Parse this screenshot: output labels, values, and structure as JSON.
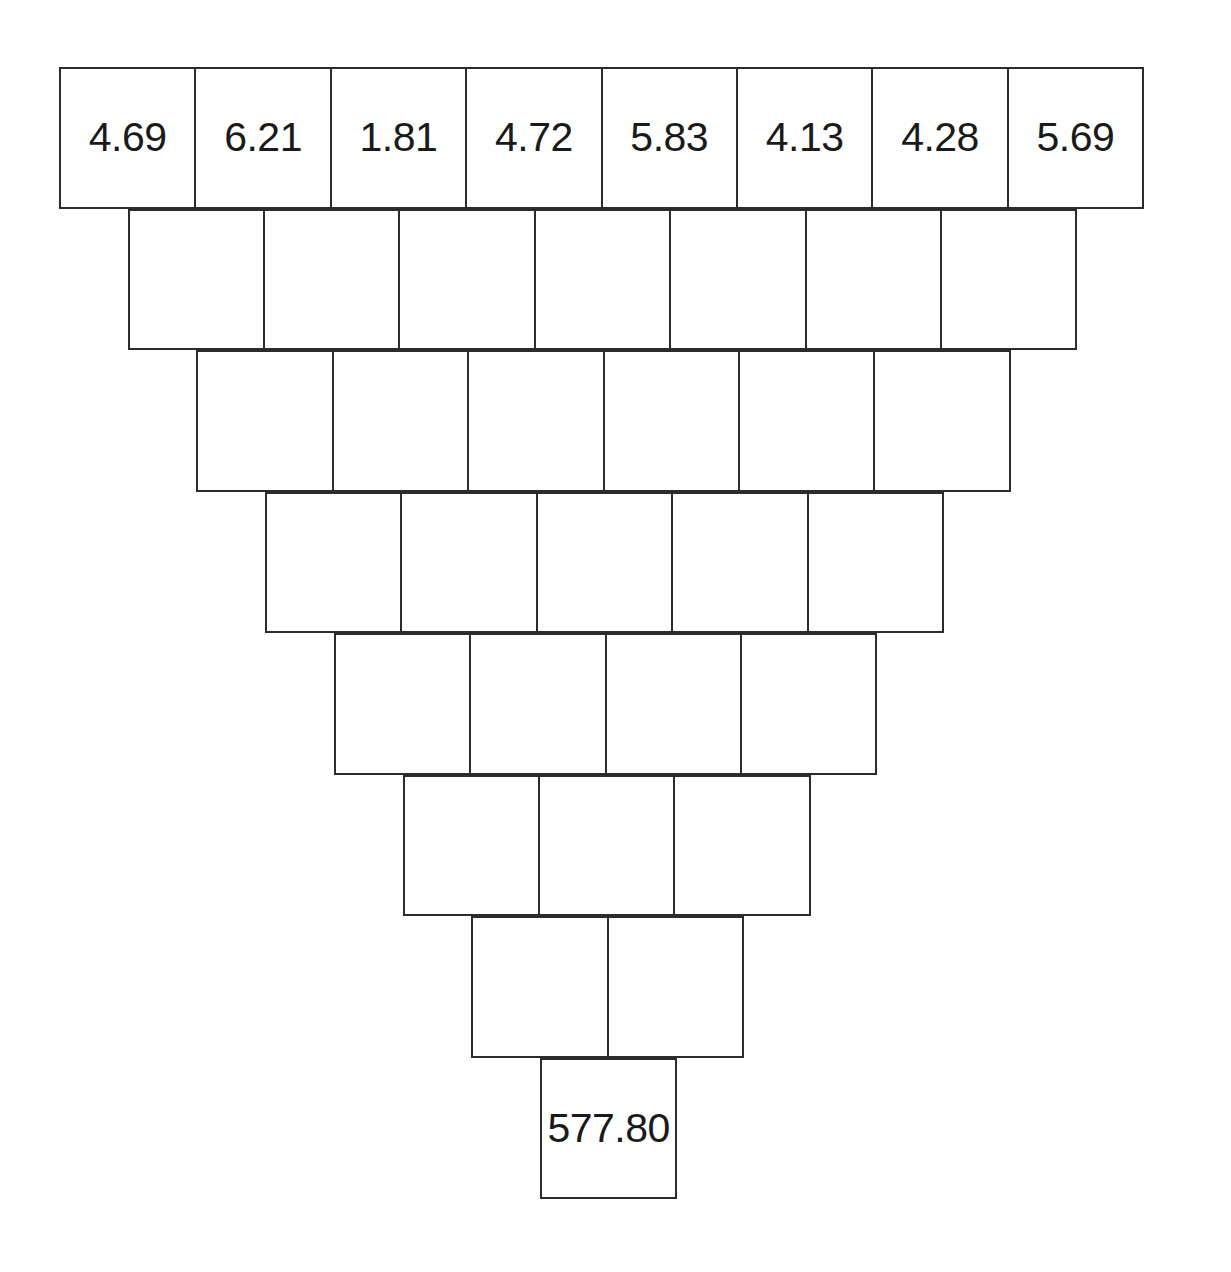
{
  "figure": {
    "name": "number-pyramid",
    "background_color": "#ffffff",
    "line_color": "#2b2b2b",
    "text_color": "#1a1a1a"
  },
  "layout": {
    "origin_x": 59,
    "origin_y": 67,
    "cell_width": 137.4,
    "cell_height": 141.5,
    "row_x_offset": 68.7,
    "border_width": 2
  },
  "chart_data": {
    "type": "table",
    "title": "",
    "xlabel": "",
    "ylabel": "",
    "rows": [
      {
        "index": 0,
        "count": 8,
        "values": [
          "4.69",
          "6.21",
          "1.81",
          "4.72",
          "5.83",
          "4.13",
          "4.28",
          "5.69"
        ]
      },
      {
        "index": 1,
        "count": 7,
        "values": [
          "",
          "",
          "",
          "",
          "",
          "",
          ""
        ]
      },
      {
        "index": 2,
        "count": 6,
        "values": [
          "",
          "",
          "",
          "",
          "",
          ""
        ]
      },
      {
        "index": 3,
        "count": 5,
        "values": [
          "",
          "",
          "",
          "",
          ""
        ]
      },
      {
        "index": 4,
        "count": 4,
        "values": [
          "",
          "",
          "",
          ""
        ]
      },
      {
        "index": 5,
        "count": 3,
        "values": [
          "",
          "",
          ""
        ]
      },
      {
        "index": 6,
        "count": 2,
        "values": [
          "",
          ""
        ]
      },
      {
        "index": 7,
        "count": 1,
        "values": [
          "577.80"
        ]
      }
    ]
  }
}
